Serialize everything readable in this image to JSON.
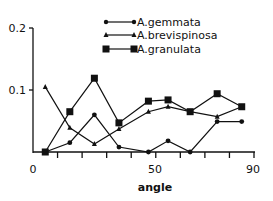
{
  "chart_data": {
    "type": "line",
    "title": "",
    "xlabel": "angle",
    "ylabel": "",
    "xlim": [
      0,
      90
    ],
    "ylim": [
      0,
      0.2
    ],
    "x_ticks": [
      0,
      10,
      20,
      30,
      40,
      50,
      60,
      70,
      80,
      90
    ],
    "x_tick_labels": [
      {
        "value": 0,
        "label": "0"
      },
      {
        "value": 50,
        "label": "50"
      },
      {
        "value": 90,
        "label": "90"
      }
    ],
    "y_tick_labels": [
      {
        "value": 0.2,
        "label": "0.2"
      },
      {
        "value": 0.1,
        "label": "0.1"
      }
    ],
    "grid": false,
    "legend_position": "top-center",
    "series": [
      {
        "name": "A.gemmata",
        "marker": "circle",
        "x": [
          5,
          15,
          25,
          35,
          47,
          55,
          64,
          75,
          85
        ],
        "values": [
          0.0,
          0.015,
          0.06,
          0.008,
          0.0,
          0.018,
          0.0,
          0.049,
          0.049
        ]
      },
      {
        "name": "A.brevispinosa",
        "marker": "triangle",
        "x": [
          5,
          15,
          25,
          35,
          47,
          55,
          64,
          75,
          85
        ],
        "values": [
          0.105,
          0.039,
          0.013,
          0.037,
          0.065,
          0.073,
          0.065,
          0.057,
          0.073
        ]
      },
      {
        "name": "A.granulata",
        "marker": "square",
        "x": [
          5,
          15,
          25,
          35,
          47,
          55,
          64,
          75,
          85
        ],
        "values": [
          0.0,
          0.065,
          0.119,
          0.047,
          0.082,
          0.084,
          0.065,
          0.094,
          0.073
        ]
      }
    ]
  },
  "axes": {
    "x_label": "angle",
    "x_tick_0": "0",
    "x_tick_50": "50",
    "x_tick_90": "90",
    "y_tick_02": "0.2",
    "y_tick_01": "0.1"
  },
  "legend": {
    "items": [
      {
        "label": "A.gemmata"
      },
      {
        "label": "A.brevispinosa"
      },
      {
        "label": "A.granulata"
      }
    ]
  }
}
